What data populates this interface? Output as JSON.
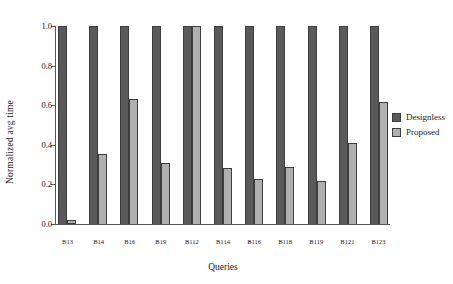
{
  "chart_data": {
    "type": "bar",
    "title": "",
    "xlabel": "Queries",
    "ylabel": "Normalized avg time",
    "ylim": [
      0.0,
      1.0
    ],
    "yticks": [
      "0.0",
      "0.2",
      "0.4",
      "0.6",
      "0.8",
      "1.0"
    ],
    "ytick_values": [
      0.0,
      0.2,
      0.4,
      0.6,
      0.8,
      1.0
    ],
    "grid": false,
    "legend_position": "right",
    "categories": [
      "B13",
      "B14",
      "B16",
      "B19",
      "B112",
      "B114",
      "B116",
      "B118",
      "B119",
      "B121",
      "B123"
    ],
    "series": [
      {
        "name": "Designless",
        "color": "#5a5a5a",
        "values": [
          1.0,
          1.0,
          1.0,
          1.0,
          1.0,
          1.0,
          1.0,
          1.0,
          1.0,
          1.0,
          1.0
        ]
      },
      {
        "name": "Proposed",
        "color": "#b0b0b0",
        "values": [
          0.02,
          0.355,
          0.63,
          0.31,
          1.0,
          0.285,
          0.225,
          0.29,
          0.215,
          0.41,
          0.615
        ]
      }
    ]
  }
}
